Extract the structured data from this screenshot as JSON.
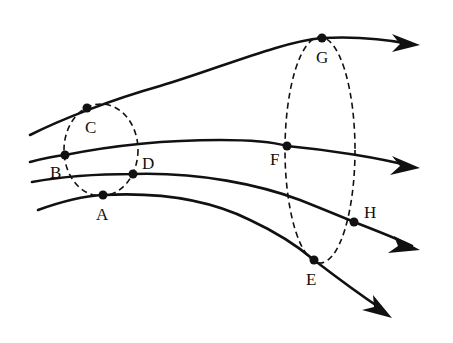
{
  "diagram": {
    "type": "field-lines-with-closed-surfaces",
    "colors": {
      "line": "#111111",
      "background": "#ffffff"
    },
    "field_lines": [
      {
        "id": "line-1",
        "passes_through": [
          "C",
          "G"
        ],
        "direction": "right"
      },
      {
        "id": "line-2",
        "passes_through": [
          "B",
          "F"
        ],
        "direction": "right"
      },
      {
        "id": "line-3",
        "passes_through": [
          "D",
          "H"
        ],
        "direction": "right"
      },
      {
        "id": "line-4",
        "passes_through": [
          "A",
          "E"
        ],
        "direction": "right-down"
      }
    ],
    "closed_surfaces": [
      {
        "id": "small-ellipse",
        "style": "dashed",
        "points_on_boundary": [
          "A",
          "B",
          "C",
          "D"
        ]
      },
      {
        "id": "large-ellipse",
        "style": "dashed",
        "points_on_boundary": [
          "E",
          "F",
          "G",
          "H"
        ]
      }
    ],
    "points": {
      "A": "A",
      "B": "B",
      "C": "C",
      "D": "D",
      "E": "E",
      "F": "F",
      "G": "G",
      "H": "H"
    }
  }
}
